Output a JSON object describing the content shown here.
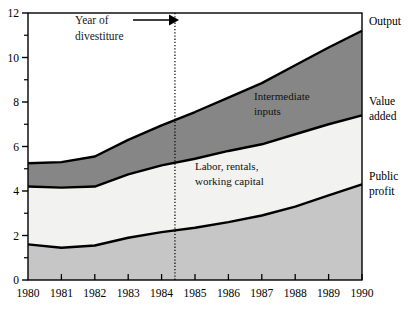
{
  "chart_data": {
    "type": "area",
    "title": "",
    "xlabel": "",
    "ylabel": "",
    "stacked": true,
    "grid": false,
    "legend_position": "inline-right",
    "x": [
      1980,
      1981,
      1982,
      1983,
      1984,
      1985,
      1986,
      1987,
      1988,
      1989,
      1990
    ],
    "xlim": [
      1980,
      1990
    ],
    "ylim": [
      0,
      12
    ],
    "yticks": [
      0,
      2,
      4,
      6,
      8,
      10,
      12
    ],
    "ytick_labels": [
      "0",
      "2",
      "4",
      "6",
      "8",
      "10",
      "12"
    ],
    "minor_yticks": [
      1,
      3,
      5,
      7,
      9,
      11
    ],
    "xtick_labels": [
      "1980",
      "1981",
      "1982",
      "1983",
      "1984",
      "1985",
      "1986",
      "1987",
      "1988",
      "1989",
      "1990"
    ],
    "series": [
      {
        "name": "Public profit",
        "fill": "#c6c6c6",
        "band_label": "",
        "right_label": "Public profit",
        "values": [
          1.6,
          1.45,
          1.55,
          1.9,
          2.15,
          2.35,
          2.6,
          2.9,
          3.3,
          3.8,
          4.3
        ]
      },
      {
        "name": "Labor, rentals, working capital",
        "fill": "#f2f2f0",
        "band_label": "Labor, rentals,\nworking capital",
        "right_label": "Value added",
        "values": [
          2.6,
          2.7,
          2.65,
          2.85,
          3.0,
          3.1,
          3.2,
          3.2,
          3.25,
          3.2,
          3.1
        ]
      },
      {
        "name": "Intermediate inputs",
        "fill": "#868686",
        "band_label": "Intermediate\ninputs",
        "right_label": "Output",
        "values": [
          1.05,
          1.15,
          1.35,
          1.55,
          1.8,
          2.1,
          2.4,
          2.75,
          3.1,
          3.45,
          3.8
        ]
      }
    ],
    "cumulative": {
      "public_profit": [
        1.6,
        1.45,
        1.55,
        1.9,
        2.15,
        2.35,
        2.6,
        2.9,
        3.3,
        3.8,
        4.3
      ],
      "value_added": [
        4.2,
        4.15,
        4.2,
        4.75,
        5.15,
        5.45,
        5.8,
        6.1,
        6.55,
        7.0,
        7.4
      ],
      "output": [
        5.25,
        5.3,
        5.55,
        6.3,
        6.95,
        7.55,
        8.2,
        8.85,
        9.65,
        10.45,
        11.2
      ]
    },
    "annotations": [
      {
        "name": "divestiture-annotation",
        "text_line1": "Year of",
        "text_line2": "divestiture",
        "arrow": true,
        "marker_type": "vertical-dotted-line",
        "marker_x": 1984.4
      }
    ],
    "band_labels": {
      "intermediate_inputs_line1": "Intermediate",
      "intermediate_inputs_line2": "inputs",
      "labor_line1": "Labor, rentals,",
      "labor_line2": "working capital"
    },
    "right_labels": {
      "output": "Output",
      "value_added_line1": "Value",
      "value_added_line2": "added",
      "public_profit_line1": "Public",
      "public_profit_line2": "profit"
    },
    "colors": {
      "intermediate_inputs_fill": "#868686",
      "labor_fill": "#f2f2f0",
      "public_profit_fill": "#c6c6c6",
      "axis": "#000000",
      "curve": "#000000",
      "background": "#ffffff"
    }
  }
}
